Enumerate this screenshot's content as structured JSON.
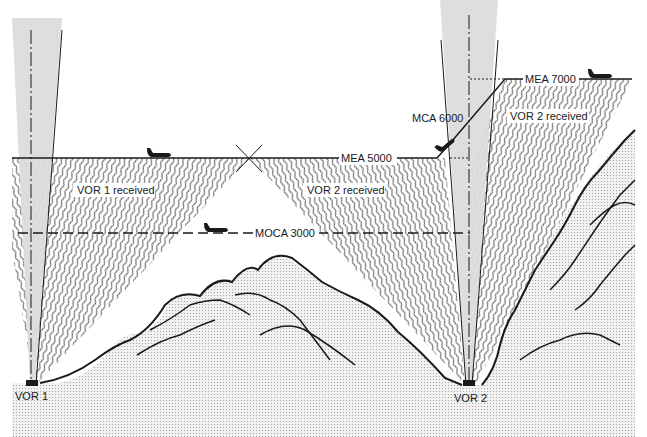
{
  "diagram": {
    "colors": {
      "ink": "#1a1a1a",
      "cone": "#dcdcdc",
      "terrain": "#e6e6e6",
      "background": "#ffffff"
    },
    "stations": [
      {
        "id": "vor1",
        "label": "VOR 1"
      },
      {
        "id": "vor2",
        "label": "VOR 2"
      }
    ],
    "altitudes": {
      "mea_5000": "MEA 5000",
      "mea_7000": "MEA 7000",
      "mca_6000": "MCA 6000",
      "moca_3000": "MOCA 3000"
    },
    "regions": {
      "vor1_received": "VOR 1 received",
      "vor2_received_left": "VOR 2 received",
      "vor2_received_right": "VOR 2 received"
    },
    "aircraft": [
      {
        "id": "aircraft-mea5000",
        "altitude": "MEA 5000"
      },
      {
        "id": "aircraft-moca3000",
        "altitude": "MOCA 3000"
      },
      {
        "id": "aircraft-climb",
        "altitude": "MCA 6000"
      },
      {
        "id": "aircraft-mea7000",
        "altitude": "MEA 7000"
      }
    ]
  }
}
